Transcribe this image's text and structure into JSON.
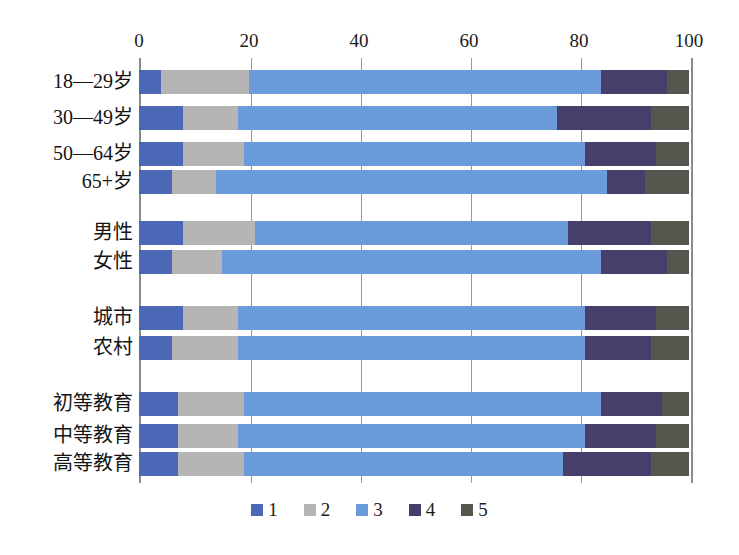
{
  "chart_data": {
    "type": "bar",
    "orientation": "horizontal",
    "stacked": true,
    "stacked_mode": "percent",
    "title": "",
    "subtitle": "",
    "xlabel": "",
    "ylabel": "",
    "xlim": [
      0,
      100
    ],
    "xticks": [
      0,
      20,
      40,
      60,
      80,
      100
    ],
    "xtick_labels": [
      "0",
      "20",
      "40",
      "60",
      "80",
      "100"
    ],
    "grid": true,
    "grid_axis": "x",
    "legend_position": "bottom",
    "legend": [
      "1",
      "2",
      "3",
      "4",
      "5"
    ],
    "series": [
      {
        "name": "1",
        "color": "#4a68b5",
        "values": [
          4,
          8,
          8,
          6,
          8,
          6,
          8,
          6,
          7,
          7,
          7
        ]
      },
      {
        "name": "2",
        "color": "#b5b5b5",
        "values": [
          16,
          10,
          11,
          8,
          13,
          9,
          10,
          12,
          12,
          11,
          12
        ]
      },
      {
        "name": "3",
        "color": "#6b9bd8",
        "values": [
          64,
          58,
          62,
          71,
          57,
          69,
          63,
          63,
          65,
          63,
          58
        ]
      },
      {
        "name": "4",
        "color": "#463f6b",
        "values": [
          12,
          17,
          13,
          7,
          15,
          12,
          13,
          12,
          11,
          13,
          16
        ]
      },
      {
        "name": "5",
        "color": "#56564f",
        "values": [
          4,
          7,
          6,
          8,
          7,
          4,
          6,
          7,
          5,
          6,
          7
        ]
      }
    ],
    "categories": [
      "18—29岁",
      "30—49岁",
      "50—64岁",
      "65+岁",
      "男性",
      "女性",
      "城市",
      "农村",
      "初等教育",
      "中等教育",
      "高等教育"
    ],
    "category_groups": [
      {
        "name": "age",
        "categories": [
          "18—29岁",
          "30—49岁",
          "50—64岁",
          "65+岁"
        ]
      },
      {
        "name": "gender",
        "categories": [
          "男性",
          "女性"
        ]
      },
      {
        "name": "settlement",
        "categories": [
          "城市",
          "农村"
        ]
      },
      {
        "name": "education",
        "categories": [
          "初等教育",
          "中等教育",
          "高等教育"
        ]
      }
    ]
  },
  "rows": [
    {
      "label": "18—29岁",
      "top": 12,
      "height": 24,
      "segments": [
        4,
        16,
        64,
        12,
        4
      ]
    },
    {
      "label": "30—49岁",
      "top": 48,
      "height": 24,
      "segments": [
        8,
        10,
        58,
        17,
        7
      ]
    },
    {
      "label": "50—64岁",
      "top": 84,
      "height": 24,
      "segments": [
        8,
        11,
        62,
        13,
        6
      ]
    },
    {
      "label": "65+岁",
      "top": 112,
      "height": 24,
      "segments": [
        6,
        8,
        71,
        7,
        8
      ]
    },
    {
      "label": "男性",
      "top": 163,
      "height": 24,
      "segments": [
        8,
        13,
        57,
        15,
        7
      ]
    },
    {
      "label": "女性",
      "top": 192,
      "height": 24,
      "segments": [
        6,
        9,
        69,
        12,
        4
      ]
    },
    {
      "label": "城市",
      "top": 248,
      "height": 24,
      "segments": [
        8,
        10,
        63,
        13,
        6
      ]
    },
    {
      "label": "农村",
      "top": 278,
      "height": 24,
      "segments": [
        6,
        12,
        63,
        12,
        7
      ]
    },
    {
      "label": "初等教育",
      "top": 334,
      "height": 24,
      "segments": [
        7,
        12,
        65,
        11,
        5
      ]
    },
    {
      "label": "中等教育",
      "top": 366,
      "height": 24,
      "segments": [
        7,
        11,
        63,
        13,
        6
      ]
    },
    {
      "label": "高等教育",
      "top": 394,
      "height": 24,
      "segments": [
        7,
        12,
        58,
        16,
        7
      ]
    }
  ],
  "colors": {
    "series1": "#4a68b5",
    "series2": "#b5b5b5",
    "series3": "#6b9bd8",
    "series4": "#463f6b",
    "series5": "#56564f",
    "axis": "#8b8b8b",
    "grid": "#9a9a9a",
    "background": "#ffffff",
    "text": "#1b1b1b"
  }
}
